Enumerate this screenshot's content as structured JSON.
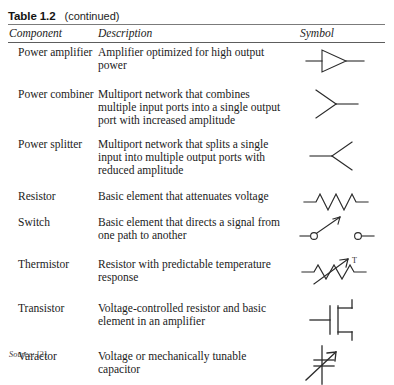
{
  "caption": {
    "label": "Table 1.2",
    "note": "(continued)"
  },
  "header": {
    "component": "Component",
    "description": "Description",
    "symbol": "Symbol"
  },
  "rows": [
    {
      "component": "Power amplifier",
      "description": "Amplifier optimized for high output power",
      "symbol_name": "amplifier-triangle-symbol"
    },
    {
      "component": "Power combiner",
      "description": "Multiport network that combines multiple input ports into a single output port with increased amplitude",
      "symbol_name": "power-combiner-symbol"
    },
    {
      "component": "Power splitter",
      "description": "Multiport network that splits a single input into multiple output ports with reduced amplitude",
      "symbol_name": "power-splitter-symbol"
    },
    {
      "component": "Resistor",
      "description": "Basic element that attenuates voltage",
      "symbol_name": "resistor-zigzag-symbol"
    },
    {
      "component": "Switch",
      "description": "Basic element that directs a signal from one path to another",
      "symbol_name": "switch-symbol"
    },
    {
      "component": "Thermistor",
      "description": "Resistor with predictable temperature response",
      "symbol_name": "thermistor-symbol",
      "symbol_label": "T"
    },
    {
      "component": "Transistor",
      "description": "Voltage-controlled resistor and basic element in an amplifier",
      "symbol_name": "transistor-fet-symbol"
    },
    {
      "component": "Varactor",
      "description": "Voltage or mechanically tunable capacitor",
      "symbol_name": "varactor-diode-symbol"
    }
  ],
  "source": {
    "label": "Source:",
    "reference": "[2]"
  },
  "colors": {
    "text": "#1b1b1b",
    "rule": "#7b7b7b",
    "symbol_stroke": "#2b2b2b",
    "background": "#ffffff"
  }
}
